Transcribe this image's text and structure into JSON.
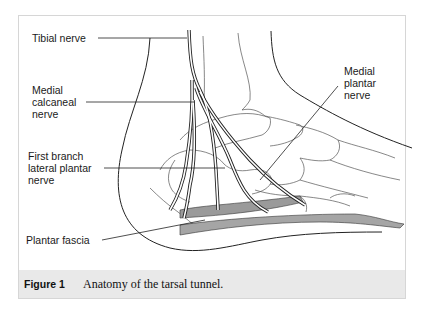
{
  "figure": {
    "labels": {
      "tibial_nerve": "Tibial nerve",
      "medial_calcaneal_nerve": "Medial\ncalcaneal\nnerve",
      "medial_plantar_nerve": "Medial\nplantar\nnerve",
      "first_branch_lateral_plantar_nerve": "First branch\nlateral plantar\nnerve",
      "plantar_fascia": "Plantar fascia"
    },
    "caption": {
      "number": "Figure 1",
      "text": "Anatomy of the tarsal tunnel."
    }
  },
  "colors": {
    "line": "#222222",
    "bone_line": "#555555",
    "fascia_fill": "#9a9a9a",
    "caption_bg": "#e9e9e9",
    "frame": "#d6d6d6"
  }
}
